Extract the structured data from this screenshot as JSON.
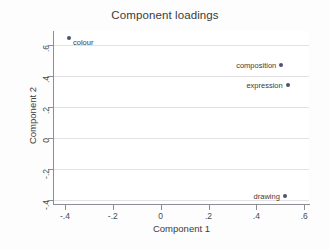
{
  "chart_data": {
    "type": "scatter",
    "title": "Component loadings",
    "xlabel": "Component 1",
    "ylabel": "Component 2",
    "xlim": [
      -0.45,
      0.62
    ],
    "ylim": [
      -0.42,
      0.69
    ],
    "grid": "horizontal",
    "legend": "none",
    "xticks": [
      {
        "value": -0.4,
        "label": "-.4"
      },
      {
        "value": -0.2,
        "label": "-.2"
      },
      {
        "value": 0,
        "label": "0"
      },
      {
        "value": 0.2,
        "label": ".2"
      },
      {
        "value": 0.4,
        "label": ".4"
      },
      {
        "value": 0.6,
        "label": ".6"
      }
    ],
    "yticks": [
      {
        "value": 0.6,
        "label": ".6"
      },
      {
        "value": 0.4,
        "label": ".4"
      },
      {
        "value": 0.2,
        "label": ".2"
      },
      {
        "value": 0,
        "label": "0"
      },
      {
        "value": -0.2,
        "label": "-.2"
      },
      {
        "value": -0.4,
        "label": "-.4"
      }
    ],
    "points": [
      {
        "label": "colour",
        "x": -0.383,
        "y": 0.648,
        "label_side": "right"
      },
      {
        "label": "composition",
        "x": 0.504,
        "y": 0.47,
        "label_side": "left"
      },
      {
        "label": "expression",
        "x": 0.531,
        "y": 0.34,
        "label_side": "left"
      },
      {
        "label": "drawing",
        "x": 0.519,
        "y": -0.372,
        "label_side": "left"
      }
    ],
    "marker_color": "#50506e",
    "grid_color": "#e2e2e6",
    "axis_color": "#8d8d93",
    "plot_background": "#ffffff",
    "figure_background": "#fdfdfd"
  }
}
